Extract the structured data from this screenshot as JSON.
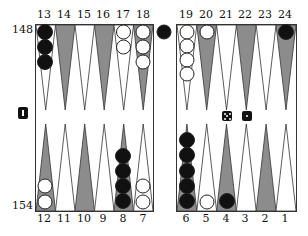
{
  "board": {
    "top_labels": [
      "13",
      "14",
      "15",
      "16",
      "17",
      "18",
      "19",
      "20",
      "21",
      "22",
      "23",
      "24"
    ],
    "bottom_labels": [
      "12",
      "11",
      "10",
      "9",
      "8",
      "7",
      "6",
      "5",
      "4",
      "3",
      "2",
      "1"
    ],
    "pip_counts": {
      "top": "148",
      "bottom": "154"
    },
    "colors": {
      "dark_point": "#8c8c8c",
      "light_point": "#ffffff",
      "black_checker": "#111111",
      "white_checker": "#ffffff",
      "border": "#333333"
    }
  },
  "checkers": {
    "point_13": {
      "color": "black",
      "count": 3
    },
    "point_17": {
      "color": "white",
      "count": 2
    },
    "point_18": {
      "color": "white",
      "count": 3
    },
    "point_19": {
      "color": "white",
      "count": 4
    },
    "point_20": {
      "color": "white",
      "count": 1
    },
    "point_24": {
      "color": "black",
      "count": 1
    },
    "point_12": {
      "color": "white",
      "count": 2
    },
    "point_8": {
      "color": "black",
      "count": 4
    },
    "point_7": {
      "color": "white",
      "count": 2
    },
    "point_6": {
      "color": "black",
      "count": 5
    },
    "point_5": {
      "color": "white",
      "count": 1
    },
    "point_4": {
      "color": "black",
      "count": 1
    },
    "bar": {
      "color": "black",
      "count": 1
    }
  },
  "dice": [
    5,
    1
  ],
  "cube": {
    "value": "1",
    "icon": "doubling-cube-icon"
  }
}
